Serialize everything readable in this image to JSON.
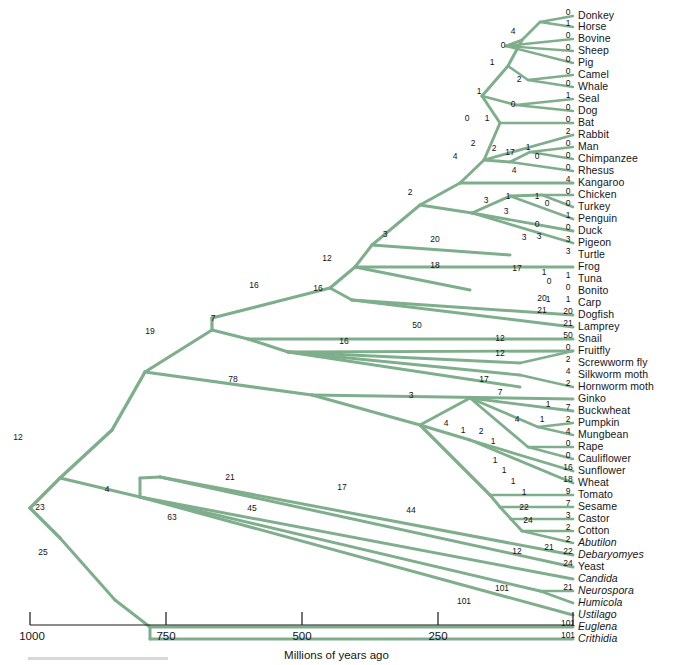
{
  "figure": {
    "kind": "phylogenetic-tree",
    "branch_color": "#7FAE8C",
    "axis": {
      "title": "Millions of years ago",
      "ticks": [
        {
          "label": "1000",
          "value": 1000,
          "x": 30
        },
        {
          "label": "750",
          "value": 750,
          "x": 166
        },
        {
          "label": "500",
          "value": 500,
          "x": 302
        },
        {
          "label": "250",
          "value": 250,
          "x": 438
        },
        {
          "label": "",
          "value": 0,
          "x": 573
        }
      ],
      "left_px": 30,
      "right_px": 573,
      "domain": [
        1000,
        0
      ]
    }
  },
  "taxa": [
    {
      "name": "Donkey",
      "italic": false,
      "y": 16,
      "change": "0"
    },
    {
      "name": "Horse",
      "italic": false,
      "y": 27,
      "change": "1"
    },
    {
      "name": "Bovine",
      "italic": false,
      "y": 39,
      "change": "0"
    },
    {
      "name": "Sheep",
      "italic": false,
      "y": 51,
      "change": "0"
    },
    {
      "name": "Pig",
      "italic": false,
      "y": 63,
      "change": "0"
    },
    {
      "name": "Camel",
      "italic": false,
      "y": 75,
      "change": "0"
    },
    {
      "name": "Whale",
      "italic": false,
      "y": 87,
      "change": "0"
    },
    {
      "name": "Seal",
      "italic": false,
      "y": 99,
      "change": "1"
    },
    {
      "name": "Dog",
      "italic": false,
      "y": 111,
      "change": "0"
    },
    {
      "name": "Bat",
      "italic": false,
      "y": 123,
      "change": "0"
    },
    {
      "name": "Rabbit",
      "italic": false,
      "y": 135,
      "change": "2"
    },
    {
      "name": "Man",
      "italic": false,
      "y": 147,
      "change": "0"
    },
    {
      "name": "Chimpanzee",
      "italic": false,
      "y": 159,
      "change": "0"
    },
    {
      "name": "Rhesus",
      "italic": false,
      "y": 171,
      "change": "0"
    },
    {
      "name": "Kangaroo",
      "italic": false,
      "y": 183,
      "change": "4"
    },
    {
      "name": "Chicken",
      "italic": false,
      "y": 195,
      "change": "0"
    },
    {
      "name": "Turkey",
      "italic": false,
      "y": 207,
      "change": "0"
    },
    {
      "name": "Penguin",
      "italic": false,
      "y": 219,
      "change": "1"
    },
    {
      "name": "Duck",
      "italic": false,
      "y": 231,
      "change": "0"
    },
    {
      "name": "Pigeon",
      "italic": false,
      "y": 243,
      "change": "3"
    },
    {
      "name": "Turtle",
      "italic": false,
      "y": 255,
      "change": "3"
    },
    {
      "name": "Frog",
      "italic": false,
      "y": 267,
      "change": ""
    },
    {
      "name": "Tuna",
      "italic": false,
      "y": 279,
      "change": "1"
    },
    {
      "name": "Bonito",
      "italic": false,
      "y": 291,
      "change": "0"
    },
    {
      "name": "Carp",
      "italic": false,
      "y": 303,
      "change": "1"
    },
    {
      "name": "Dogfish",
      "italic": false,
      "y": 315,
      "change": "20"
    },
    {
      "name": "Lamprey",
      "italic": false,
      "y": 327,
      "change": "21"
    },
    {
      "name": "Snail",
      "italic": false,
      "y": 339,
      "change": "50"
    },
    {
      "name": "Fruitfly",
      "italic": false,
      "y": 351,
      "change": "0"
    },
    {
      "name": "Screwworm fly",
      "italic": false,
      "y": 363,
      "change": "2"
    },
    {
      "name": "Silkworm moth",
      "italic": false,
      "y": 375,
      "change": "4"
    },
    {
      "name": "Hornworm moth",
      "italic": false,
      "y": 387,
      "change": "2"
    },
    {
      "name": "Ginko",
      "italic": false,
      "y": 399,
      "change": ""
    },
    {
      "name": "Buckwheat",
      "italic": false,
      "y": 411,
      "change": "7"
    },
    {
      "name": "Pumpkin",
      "italic": false,
      "y": 423,
      "change": "2"
    },
    {
      "name": "Mungbean",
      "italic": false,
      "y": 435,
      "change": "4"
    },
    {
      "name": "Rape",
      "italic": false,
      "y": 447,
      "change": "0"
    },
    {
      "name": "Cauliflower",
      "italic": false,
      "y": 459,
      "change": "0"
    },
    {
      "name": "Sunflower",
      "italic": false,
      "y": 471,
      "change": "16"
    },
    {
      "name": "Wheat",
      "italic": false,
      "y": 483,
      "change": "18"
    },
    {
      "name": "Tomato",
      "italic": false,
      "y": 495,
      "change": "9"
    },
    {
      "name": "Sesame",
      "italic": false,
      "y": 507,
      "change": "7"
    },
    {
      "name": "Castor",
      "italic": false,
      "y": 519,
      "change": "3"
    },
    {
      "name": "Cotton",
      "italic": false,
      "y": 531,
      "change": "2"
    },
    {
      "name": "Abutilon",
      "italic": true,
      "y": 543,
      "change": "2"
    },
    {
      "name": "Debaryomyes",
      "italic": true,
      "y": 555,
      "change": "22"
    },
    {
      "name": "Yeast",
      "italic": false,
      "y": 567,
      "change": "24"
    },
    {
      "name": "Candida",
      "italic": true,
      "y": 579,
      "change": ""
    },
    {
      "name": "Neurospora",
      "italic": true,
      "y": 591,
      "change": "21"
    },
    {
      "name": "Humicola",
      "italic": true,
      "y": 603,
      "change": ""
    },
    {
      "name": "Ustilago",
      "italic": true,
      "y": 615,
      "change": ""
    },
    {
      "name": "Euglena",
      "italic": true,
      "y": 627,
      "change": "101"
    },
    {
      "name": "Crithidia",
      "italic": true,
      "y": 639,
      "change": "101"
    }
  ],
  "branch_numbers": [
    {
      "label": "4",
      "x": 513,
      "y": 31
    },
    {
      "label": "0",
      "x": 503,
      "y": 45
    },
    {
      "label": "1",
      "x": 492,
      "y": 62
    },
    {
      "label": "2",
      "x": 519,
      "y": 79
    },
    {
      "label": "1",
      "x": 479,
      "y": 91
    },
    {
      "label": "0",
      "x": 513,
      "y": 104
    },
    {
      "label": "0",
      "x": 467,
      "y": 118
    },
    {
      "label": "1",
      "x": 487,
      "y": 118
    },
    {
      "label": "2",
      "x": 494,
      "y": 148
    },
    {
      "label": "17",
      "x": 510,
      "y": 152
    },
    {
      "label": "1",
      "x": 528,
      "y": 147
    },
    {
      "label": "0",
      "x": 537,
      "y": 156
    },
    {
      "label": "4",
      "x": 514,
      "y": 170
    },
    {
      "label": "4",
      "x": 455,
      "y": 156
    },
    {
      "label": "2",
      "x": 473,
      "y": 143
    },
    {
      "label": "2",
      "x": 410,
      "y": 192
    },
    {
      "label": "3",
      "x": 486,
      "y": 200
    },
    {
      "label": "1",
      "x": 508,
      "y": 196
    },
    {
      "label": "1",
      "x": 537,
      "y": 196
    },
    {
      "label": "0",
      "x": 547,
      "y": 203
    },
    {
      "label": "3",
      "x": 506,
      "y": 211
    },
    {
      "label": "0",
      "x": 537,
      "y": 224
    },
    {
      "label": "3",
      "x": 539,
      "y": 236
    },
    {
      "label": "3",
      "x": 385,
      "y": 234
    },
    {
      "label": "20",
      "x": 435,
      "y": 239
    },
    {
      "label": "3",
      "x": 524,
      "y": 237
    },
    {
      "label": "12",
      "x": 327,
      "y": 258
    },
    {
      "label": "18",
      "x": 435,
      "y": 265
    },
    {
      "label": "17",
      "x": 517,
      "y": 268
    },
    {
      "label": "1",
      "x": 544,
      "y": 272
    },
    {
      "label": "0",
      "x": 549,
      "y": 281
    },
    {
      "label": "1",
      "x": 548,
      "y": 299
    },
    {
      "label": "16",
      "x": 254,
      "y": 285
    },
    {
      "label": "16",
      "x": 318,
      "y": 288
    },
    {
      "label": "20",
      "x": 542,
      "y": 298
    },
    {
      "label": "21",
      "x": 542,
      "y": 310
    },
    {
      "label": "7",
      "x": 213,
      "y": 318
    },
    {
      "label": "19",
      "x": 150,
      "y": 331
    },
    {
      "label": "50",
      "x": 417,
      "y": 325
    },
    {
      "label": "16",
      "x": 344,
      "y": 341
    },
    {
      "label": "12",
      "x": 500,
      "y": 338
    },
    {
      "label": "12",
      "x": 500,
      "y": 353
    },
    {
      "label": "78",
      "x": 233,
      "y": 379
    },
    {
      "label": "17",
      "x": 484,
      "y": 379
    },
    {
      "label": "3",
      "x": 411,
      "y": 395
    },
    {
      "label": "7",
      "x": 500,
      "y": 392
    },
    {
      "label": "1",
      "x": 548,
      "y": 404
    },
    {
      "label": "4",
      "x": 517,
      "y": 419
    },
    {
      "label": "1",
      "x": 542,
      "y": 419
    },
    {
      "label": "4",
      "x": 446,
      "y": 423
    },
    {
      "label": "1",
      "x": 463,
      "y": 430
    },
    {
      "label": "2",
      "x": 481,
      "y": 431
    },
    {
      "label": "1",
      "x": 493,
      "y": 441
    },
    {
      "label": "1",
      "x": 495,
      "y": 460
    },
    {
      "label": "1",
      "x": 504,
      "y": 470
    },
    {
      "label": "1",
      "x": 513,
      "y": 481
    },
    {
      "label": "1",
      "x": 524,
      "y": 492
    },
    {
      "label": "12",
      "x": 18,
      "y": 437
    },
    {
      "label": "21",
      "x": 230,
      "y": 477
    },
    {
      "label": "17",
      "x": 342,
      "y": 487
    },
    {
      "label": "44",
      "x": 411,
      "y": 510
    },
    {
      "label": "22",
      "x": 524,
      "y": 507
    },
    {
      "label": "4",
      "x": 107,
      "y": 489
    },
    {
      "label": "23",
      "x": 40,
      "y": 507
    },
    {
      "label": "63",
      "x": 172,
      "y": 517
    },
    {
      "label": "45",
      "x": 252,
      "y": 508
    },
    {
      "label": "24",
      "x": 528,
      "y": 520
    },
    {
      "label": "21",
      "x": 549,
      "y": 547
    },
    {
      "label": "12",
      "x": 517,
      "y": 551
    },
    {
      "label": "25",
      "x": 43,
      "y": 552
    },
    {
      "label": "101",
      "x": 502,
      "y": 588
    },
    {
      "label": "101",
      "x": 464,
      "y": 601
    }
  ],
  "tree_edges": [
    {
      "x1": 30,
      "y1": 508,
      "x2": 60,
      "y2": 478,
      "w": 3.4
    },
    {
      "x1": 30,
      "y1": 508,
      "x2": 60,
      "y2": 538,
      "w": 3.4
    },
    {
      "x1": 60,
      "y1": 478,
      "x2": 112,
      "y2": 430,
      "w": 3.4
    },
    {
      "x1": 112,
      "y1": 430,
      "x2": 145,
      "y2": 372,
      "w": 3.4
    },
    {
      "x1": 60,
      "y1": 478,
      "x2": 140,
      "y2": 497,
      "w": 3.0
    },
    {
      "x1": 140,
      "y1": 497,
      "x2": 140,
      "y2": 478,
      "w": 3.0
    },
    {
      "x1": 140,
      "y1": 478,
      "x2": 160,
      "y2": 477,
      "w": 3.0
    },
    {
      "x1": 60,
      "y1": 538,
      "x2": 115,
      "y2": 600,
      "w": 3.0
    },
    {
      "x1": 115,
      "y1": 600,
      "x2": 150,
      "y2": 627,
      "w": 3.0
    },
    {
      "x1": 150,
      "y1": 627,
      "x2": 573,
      "y2": 627,
      "w": 3.0
    },
    {
      "x1": 150,
      "y1": 627,
      "x2": 150,
      "y2": 639,
      "w": 3.0
    },
    {
      "x1": 150,
      "y1": 639,
      "x2": 573,
      "y2": 639,
      "w": 3.0
    },
    {
      "x1": 145,
      "y1": 372,
      "x2": 312,
      "y2": 395,
      "w": 3.2
    },
    {
      "x1": 145,
      "y1": 372,
      "x2": 212,
      "y2": 330,
      "w": 3.2
    },
    {
      "x1": 212,
      "y1": 330,
      "x2": 212,
      "y2": 318,
      "w": 3.2
    },
    {
      "x1": 212,
      "y1": 318,
      "x2": 330,
      "y2": 288,
      "w": 3.2
    },
    {
      "x1": 212,
      "y1": 330,
      "x2": 248,
      "y2": 339,
      "w": 3.0
    },
    {
      "x1": 248,
      "y1": 339,
      "x2": 573,
      "y2": 339,
      "w": 3.0
    },
    {
      "x1": 248,
      "y1": 339,
      "x2": 288,
      "y2": 352,
      "w": 3.0
    },
    {
      "x1": 330,
      "y1": 288,
      "x2": 355,
      "y2": 267,
      "w": 3.2
    },
    {
      "x1": 355,
      "y1": 267,
      "x2": 573,
      "y2": 267,
      "w": 3.0
    },
    {
      "x1": 355,
      "y1": 267,
      "x2": 470,
      "y2": 290,
      "w": 3.0
    },
    {
      "x1": 330,
      "y1": 288,
      "x2": 352,
      "y2": 300,
      "w": 3.0
    },
    {
      "x1": 352,
      "y1": 300,
      "x2": 573,
      "y2": 315,
      "w": 3.0
    },
    {
      "x1": 352,
      "y1": 300,
      "x2": 573,
      "y2": 327,
      "w": 3.0
    },
    {
      "x1": 355,
      "y1": 267,
      "x2": 372,
      "y2": 245,
      "w": 3.0
    },
    {
      "x1": 372,
      "y1": 245,
      "x2": 510,
      "y2": 255,
      "w": 3.0
    },
    {
      "x1": 372,
      "y1": 245,
      "x2": 420,
      "y2": 205,
      "w": 3.0
    },
    {
      "x1": 420,
      "y1": 205,
      "x2": 460,
      "y2": 183,
      "w": 3.0
    },
    {
      "x1": 460,
      "y1": 183,
      "x2": 573,
      "y2": 183,
      "w": 3.0
    },
    {
      "x1": 420,
      "y1": 205,
      "x2": 472,
      "y2": 213,
      "w": 3.0
    },
    {
      "x1": 472,
      "y1": 213,
      "x2": 510,
      "y2": 196,
      "w": 3.0
    },
    {
      "x1": 510,
      "y1": 196,
      "x2": 542,
      "y2": 195,
      "w": 2.8
    },
    {
      "x1": 542,
      "y1": 195,
      "x2": 573,
      "y2": 195,
      "w": 2.6
    },
    {
      "x1": 542,
      "y1": 195,
      "x2": 573,
      "y2": 207,
      "w": 2.6
    },
    {
      "x1": 510,
      "y1": 196,
      "x2": 573,
      "y2": 219,
      "w": 2.8
    },
    {
      "x1": 472,
      "y1": 213,
      "x2": 573,
      "y2": 231,
      "w": 2.8
    },
    {
      "x1": 472,
      "y1": 213,
      "x2": 573,
      "y2": 243,
      "w": 2.8
    },
    {
      "x1": 460,
      "y1": 183,
      "x2": 484,
      "y2": 160,
      "w": 3.0
    },
    {
      "x1": 484,
      "y1": 160,
      "x2": 573,
      "y2": 135,
      "w": 2.8
    },
    {
      "x1": 484,
      "y1": 160,
      "x2": 510,
      "y2": 162,
      "w": 2.8
    },
    {
      "x1": 510,
      "y1": 162,
      "x2": 573,
      "y2": 171,
      "w": 2.6
    },
    {
      "x1": 510,
      "y1": 162,
      "x2": 530,
      "y2": 152,
      "w": 2.6
    },
    {
      "x1": 530,
      "y1": 152,
      "x2": 573,
      "y2": 147,
      "w": 2.4
    },
    {
      "x1": 530,
      "y1": 152,
      "x2": 573,
      "y2": 159,
      "w": 2.4
    },
    {
      "x1": 484,
      "y1": 160,
      "x2": 500,
      "y2": 123,
      "w": 3.0
    },
    {
      "x1": 500,
      "y1": 123,
      "x2": 573,
      "y2": 123,
      "w": 2.6
    },
    {
      "x1": 500,
      "y1": 123,
      "x2": 482,
      "y2": 96,
      "w": 3.0
    },
    {
      "x1": 482,
      "y1": 96,
      "x2": 516,
      "y2": 105,
      "w": 2.6
    },
    {
      "x1": 516,
      "y1": 105,
      "x2": 573,
      "y2": 99,
      "w": 2.4
    },
    {
      "x1": 516,
      "y1": 105,
      "x2": 573,
      "y2": 111,
      "w": 2.4
    },
    {
      "x1": 482,
      "y1": 96,
      "x2": 508,
      "y2": 66,
      "w": 3.0
    },
    {
      "x1": 508,
      "y1": 66,
      "x2": 528,
      "y2": 80,
      "w": 2.6
    },
    {
      "x1": 528,
      "y1": 80,
      "x2": 573,
      "y2": 75,
      "w": 2.4
    },
    {
      "x1": 528,
      "y1": 80,
      "x2": 573,
      "y2": 87,
      "w": 2.4
    },
    {
      "x1": 508,
      "y1": 66,
      "x2": 522,
      "y2": 40,
      "w": 3.0
    },
    {
      "x1": 522,
      "y1": 40,
      "x2": 506,
      "y2": 46,
      "w": 2.6
    },
    {
      "x1": 506,
      "y1": 46,
      "x2": 573,
      "y2": 39,
      "w": 2.4
    },
    {
      "x1": 506,
      "y1": 46,
      "x2": 573,
      "y2": 51,
      "w": 2.4
    },
    {
      "x1": 506,
      "y1": 46,
      "x2": 573,
      "y2": 63,
      "w": 2.4
    },
    {
      "x1": 522,
      "y1": 40,
      "x2": 540,
      "y2": 22,
      "w": 2.8
    },
    {
      "x1": 540,
      "y1": 22,
      "x2": 573,
      "y2": 16,
      "w": 2.4
    },
    {
      "x1": 540,
      "y1": 22,
      "x2": 573,
      "y2": 27,
      "w": 2.4
    },
    {
      "x1": 288,
      "y1": 352,
      "x2": 573,
      "y2": 351,
      "w": 2.8
    },
    {
      "x1": 288,
      "y1": 352,
      "x2": 520,
      "y2": 363,
      "w": 2.8
    },
    {
      "x1": 288,
      "y1": 352,
      "x2": 520,
      "y2": 375,
      "w": 2.8
    },
    {
      "x1": 288,
      "y1": 352,
      "x2": 520,
      "y2": 387,
      "w": 2.8
    },
    {
      "x1": 520,
      "y1": 363,
      "x2": 573,
      "y2": 351,
      "w": 2.6
    },
    {
      "x1": 520,
      "y1": 375,
      "x2": 573,
      "y2": 387,
      "w": 2.6
    },
    {
      "x1": 312,
      "y1": 395,
      "x2": 573,
      "y2": 399,
      "w": 3.0
    },
    {
      "x1": 312,
      "y1": 395,
      "x2": 420,
      "y2": 425,
      "w": 3.2
    },
    {
      "x1": 420,
      "y1": 425,
      "x2": 470,
      "y2": 398,
      "w": 3.0
    },
    {
      "x1": 470,
      "y1": 398,
      "x2": 573,
      "y2": 411,
      "w": 2.8
    },
    {
      "x1": 470,
      "y1": 398,
      "x2": 538,
      "y2": 427,
      "w": 2.8
    },
    {
      "x1": 538,
      "y1": 427,
      "x2": 573,
      "y2": 423,
      "w": 2.5
    },
    {
      "x1": 538,
      "y1": 427,
      "x2": 573,
      "y2": 435,
      "w": 2.5
    },
    {
      "x1": 470,
      "y1": 398,
      "x2": 528,
      "y2": 447,
      "w": 2.8
    },
    {
      "x1": 528,
      "y1": 447,
      "x2": 573,
      "y2": 447,
      "w": 2.5
    },
    {
      "x1": 528,
      "y1": 447,
      "x2": 573,
      "y2": 459,
      "w": 2.5
    },
    {
      "x1": 420,
      "y1": 425,
      "x2": 470,
      "y2": 440,
      "w": 3.0
    },
    {
      "x1": 470,
      "y1": 440,
      "x2": 573,
      "y2": 471,
      "w": 2.8
    },
    {
      "x1": 470,
      "y1": 440,
      "x2": 573,
      "y2": 483,
      "w": 2.8
    },
    {
      "x1": 420,
      "y1": 425,
      "x2": 490,
      "y2": 495,
      "w": 3.2
    },
    {
      "x1": 490,
      "y1": 495,
      "x2": 573,
      "y2": 495,
      "w": 2.7
    },
    {
      "x1": 490,
      "y1": 495,
      "x2": 500,
      "y2": 507,
      "w": 3.0
    },
    {
      "x1": 500,
      "y1": 507,
      "x2": 573,
      "y2": 507,
      "w": 2.7
    },
    {
      "x1": 500,
      "y1": 507,
      "x2": 511,
      "y2": 519,
      "w": 3.0
    },
    {
      "x1": 511,
      "y1": 519,
      "x2": 573,
      "y2": 519,
      "w": 2.7
    },
    {
      "x1": 511,
      "y1": 519,
      "x2": 522,
      "y2": 531,
      "w": 3.0
    },
    {
      "x1": 522,
      "y1": 531,
      "x2": 573,
      "y2": 531,
      "w": 2.7
    },
    {
      "x1": 522,
      "y1": 531,
      "x2": 573,
      "y2": 543,
      "w": 2.7
    },
    {
      "x1": 160,
      "y1": 477,
      "x2": 573,
      "y2": 555,
      "w": 3.0
    },
    {
      "x1": 160,
      "y1": 477,
      "x2": 573,
      "y2": 567,
      "w": 3.0
    },
    {
      "x1": 140,
      "y1": 497,
      "x2": 573,
      "y2": 579,
      "w": 3.0
    },
    {
      "x1": 140,
      "y1": 497,
      "x2": 540,
      "y2": 591,
      "w": 3.0
    },
    {
      "x1": 540,
      "y1": 591,
      "x2": 573,
      "y2": 591,
      "w": 2.7
    },
    {
      "x1": 540,
      "y1": 591,
      "x2": 573,
      "y2": 603,
      "w": 2.7
    },
    {
      "x1": 140,
      "y1": 497,
      "x2": 573,
      "y2": 615,
      "w": 3.0
    }
  ]
}
